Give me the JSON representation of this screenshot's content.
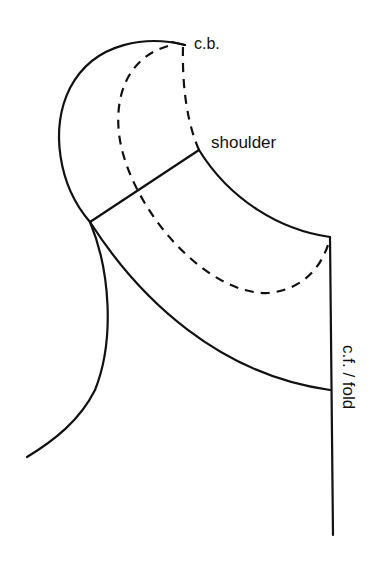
{
  "diagram": {
    "type": "sewing-pattern-collar",
    "colors": {
      "line": "#111111",
      "background": "#ffffff"
    },
    "labels": {
      "center_back": "c.b.",
      "shoulder": "shoulder",
      "center_front": "c.f. / fold"
    },
    "parts": [
      {
        "id": "outer-collar-edge",
        "style": "solid"
      },
      {
        "id": "neckline-edge",
        "style": "solid"
      },
      {
        "id": "shoulder-line",
        "style": "solid"
      },
      {
        "id": "roll-line",
        "style": "dashed"
      },
      {
        "id": "center-front-fold-line",
        "style": "solid"
      },
      {
        "id": "bodice-neck-curve",
        "style": "solid"
      },
      {
        "id": "armhole-curve",
        "style": "solid"
      }
    ]
  }
}
